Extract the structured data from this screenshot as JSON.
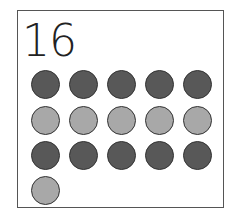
{
  "card": {
    "number": "16",
    "colors": {
      "dark": "#585858",
      "light": "#a8a8a8"
    },
    "rows": [
      [
        "dark",
        "dark",
        "dark",
        "dark",
        "dark"
      ],
      [
        "light",
        "light",
        "light",
        "light",
        "light"
      ],
      [
        "dark",
        "dark",
        "dark",
        "dark",
        "dark"
      ],
      [
        "light"
      ]
    ]
  }
}
